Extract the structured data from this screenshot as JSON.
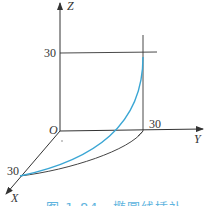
{
  "diagram": {
    "axes": {
      "x_label": "X",
      "y_label": "Y",
      "z_label": "Z",
      "origin_label": "O"
    },
    "ticks": {
      "x_tick": "30",
      "y_tick": "30",
      "z_tick": "30"
    },
    "curves": [
      {
        "name": "spatial-elliptical-arc",
        "color": "#3aa6d4"
      },
      {
        "name": "projected-arc-xy-plane",
        "color": "#444444"
      }
    ],
    "caption": "图 1-84　椭圆线插补"
  }
}
